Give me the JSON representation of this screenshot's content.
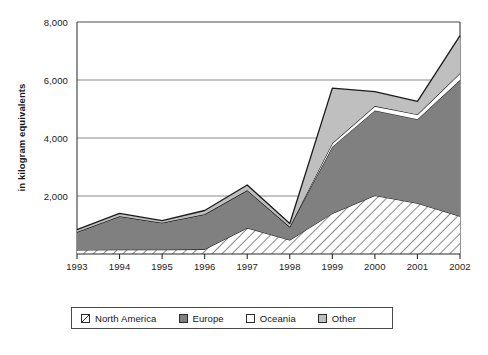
{
  "chart_data": {
    "type": "area",
    "stacked": true,
    "title": "",
    "subtitle": "",
    "xlabel": "",
    "ylabel": "in kilogram equivalents",
    "categories": [
      "1993",
      "1994",
      "1995",
      "1996",
      "1997",
      "1998",
      "1999",
      "2000",
      "2001",
      "2002"
    ],
    "x_tick_labels": [
      "1993",
      "1994",
      "1995",
      "1996",
      "1997",
      "1998",
      "1999",
      "2000",
      "2001",
      "2002"
    ],
    "y_tick_labels": [
      "2,000",
      "4,000",
      "6,000",
      "8,000"
    ],
    "y_tick_values": [
      2000,
      4000,
      6000,
      8000
    ],
    "ylim": [
      0,
      8000
    ],
    "grid": "horizontal",
    "legend_position": "bottom",
    "series": [
      {
        "name": "North America",
        "fill": "hatch-diagonal",
        "values": [
          140,
          150,
          150,
          160,
          900,
          480,
          1400,
          2020,
          1750,
          1300
        ]
      },
      {
        "name": "Europe",
        "fill": "#808080",
        "values": [
          620,
          1150,
          930,
          1210,
          1300,
          460,
          2300,
          2930,
          2900,
          4700
        ]
      },
      {
        "name": "Oceania",
        "fill": "#ffffff",
        "values": [
          0,
          0,
          0,
          0,
          0,
          0,
          120,
          150,
          160,
          230
        ]
      },
      {
        "name": "Other",
        "fill": "#bfbfbf",
        "values": [
          80,
          100,
          70,
          130,
          180,
          110,
          1900,
          500,
          450,
          1300
        ]
      }
    ],
    "series_totals": [
      840,
      1400,
      1150,
      1500,
      2380,
      1050,
      5720,
      5600,
      5260,
      7530
    ]
  },
  "legend": {
    "entries": [
      {
        "label": "North America",
        "swatch": "hatch"
      },
      {
        "label": "Europe",
        "swatch": "dark-gray"
      },
      {
        "label": "Oceania",
        "swatch": "white"
      },
      {
        "label": "Other",
        "swatch": "light-gray"
      }
    ]
  },
  "colors": {
    "europe": "#808080",
    "other": "#bfbfbf",
    "oceania": "#ffffff",
    "axis": "#4a4a4a",
    "grid": "#808080",
    "outline": "#1a1a1a",
    "text": "#1a1a1a"
  }
}
